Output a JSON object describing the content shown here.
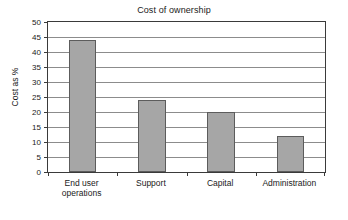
{
  "chart_data": {
    "type": "bar",
    "title": "Cost of ownership",
    "xlabel": "",
    "ylabel": "Cost as %",
    "categories": [
      "End user\noperations",
      "Support",
      "Capital",
      "Administration"
    ],
    "values": [
      44,
      24,
      20,
      12
    ],
    "ylim": [
      0,
      50
    ],
    "ytick_step": 5,
    "yticks": [
      0,
      5,
      10,
      15,
      20,
      25,
      30,
      35,
      40,
      45,
      50
    ],
    "ytick_labels": [
      "0",
      "5",
      "10",
      "15",
      "20",
      "25",
      "30",
      "35",
      "40",
      "45",
      "50"
    ],
    "grid": true,
    "grid_axis": "y",
    "legend": false,
    "legend_position": "none",
    "series": [
      {
        "name": "Cost as %",
        "values": [
          44,
          24,
          20,
          12
        ],
        "color": "#a6a6a6",
        "edge_color": "#5c5c5c"
      }
    ],
    "colors": {
      "bar_fill": "#a6a6a6",
      "bar_edge": "#5c5c5c",
      "gridline": "#8c8c8c",
      "axis": "#3a3a3a",
      "text": "#1a1a1a",
      "background": "#ffffff"
    }
  }
}
